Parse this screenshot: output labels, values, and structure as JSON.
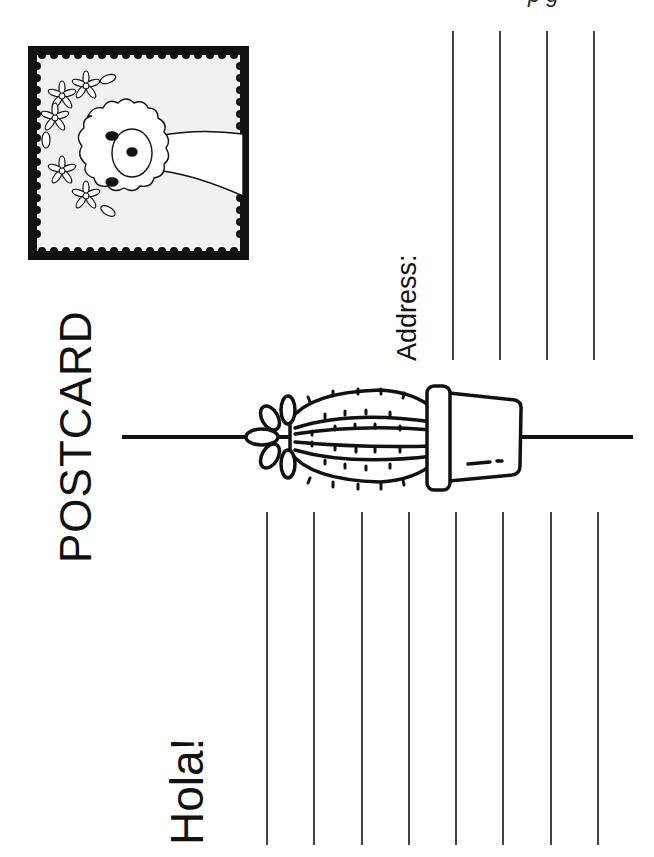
{
  "postcard": {
    "title": "POSTCARD",
    "greeting": "Hola!",
    "address_label": "Address:",
    "top_fragment": "p                    g",
    "address_lines": [
      {
        "x": 452
      },
      {
        "x": 499
      },
      {
        "x": 546
      },
      {
        "x": 593
      }
    ],
    "message_lines": [
      {
        "x": 266
      },
      {
        "x": 313
      },
      {
        "x": 361
      },
      {
        "x": 408
      },
      {
        "x": 455
      },
      {
        "x": 502
      },
      {
        "x": 550
      },
      {
        "x": 597
      }
    ],
    "stamp": {
      "subject": "alpaca-with-flower-crown",
      "frame_color": "#111111",
      "fill_color": "#f1f1f1"
    },
    "illustration": "cactus-in-pot",
    "colors": {
      "ink": "#111111",
      "line": "#444444",
      "paper": "#ffffff"
    }
  }
}
